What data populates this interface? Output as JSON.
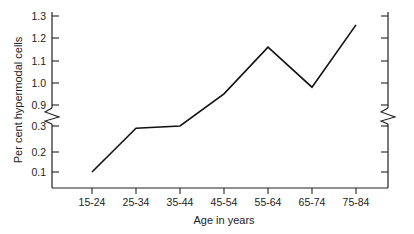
{
  "chart_data": {
    "type": "line",
    "title": "",
    "subtitle": "",
    "xlabel": "Age in years",
    "ylabel": "Per cent hypermodal cells",
    "categories": [
      "15-24",
      "25-34",
      "35-44",
      "45-54",
      "55-64",
      "65-74",
      "75-84"
    ],
    "values": [
      0.1,
      0.29,
      0.3,
      0.95,
      1.16,
      0.98,
      1.26
    ],
    "series": [
      {
        "name": "Per cent hypermodal cells",
        "values": [
          0.1,
          0.29,
          0.3,
          0.95,
          1.16,
          0.98,
          1.26
        ]
      }
    ],
    "ytick_labels": [
      "0.1",
      "0.2",
      "0.3",
      "0.9",
      "1.0",
      "1.1",
      "1.2",
      "1.3"
    ],
    "ytick_values": [
      0.1,
      0.2,
      0.3,
      0.9,
      1.0,
      1.1,
      1.2,
      1.3
    ],
    "xtick_labels": [
      "15-24",
      "25-34",
      "35-44",
      "45-54",
      "55-64",
      "65-74",
      "75-84"
    ],
    "axis_break": {
      "present": true,
      "axis": "y",
      "between_low": 0.3,
      "between_high": 0.9
    },
    "ylim": [
      0.1,
      1.3
    ],
    "grid": false,
    "legend": false,
    "legend_position": "none",
    "line_color": "#111111",
    "markers": false
  },
  "labels": {
    "y_axis_title": "Per cent hypermodal cells",
    "x_axis_title": "Age in years",
    "y0": "0.1",
    "y1": "0.2",
    "y2": "0.3",
    "y3": "0.9",
    "y4": "1.0",
    "y5": "1.1",
    "y6": "1.2",
    "y7": "1.3",
    "x0": "15-24",
    "x1": "25-34",
    "x2": "35-44",
    "x3": "45-54",
    "x4": "55-64",
    "x5": "65-74",
    "x6": "75-84"
  }
}
